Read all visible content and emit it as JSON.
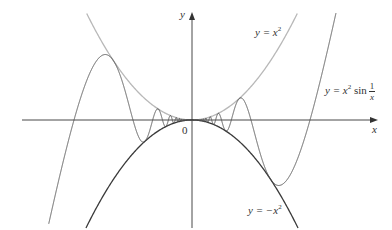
{
  "diagram": {
    "axes": {
      "x_label": "x",
      "y_label": "y",
      "origin_label": "0"
    },
    "curves": [
      {
        "name": "upper-bound",
        "label_prefix": "y = x",
        "label_exp": "2",
        "color": "#b8b8b8"
      },
      {
        "name": "lower-bound",
        "label_prefix": "y = −x",
        "label_exp": "2",
        "color": "#3a3a3a"
      },
      {
        "name": "oscillating",
        "label_prefix": "y = x",
        "label_exp": "2",
        "label_func": "sin",
        "label_frac_num": "1",
        "label_frac_den": "x",
        "color": "#555555"
      }
    ]
  },
  "chart_data": {
    "type": "line",
    "title": "",
    "xlabel": "x",
    "ylabel": "y",
    "series": [
      {
        "name": "y = x^2",
        "function": "x^2"
      },
      {
        "name": "y = -x^2",
        "function": "-x^2"
      },
      {
        "name": "y = x^2 sin(1/x)",
        "function": "x^2*sin(1/x)"
      }
    ],
    "annotations": [
      "0"
    ],
    "grid": false
  }
}
